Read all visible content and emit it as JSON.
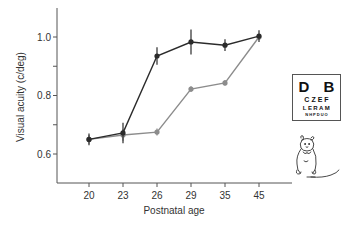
{
  "chart_data": {
    "type": "line",
    "title": "",
    "xlabel": "Postnatal age",
    "ylabel": "Visual acuity (c/deg)",
    "categories": [
      "20",
      "23",
      "26",
      "29",
      "35",
      "45"
    ],
    "x_tick_labels": [
      "20",
      "23",
      "26",
      "29",
      "35",
      "45"
    ],
    "y_tick_labels": [
      "0.6",
      "0.8",
      "1.0"
    ],
    "y_minor_ticks": [
      0.7,
      0.9
    ],
    "ylim": [
      0.5,
      1.1
    ],
    "grid": false,
    "legend": null,
    "series": [
      {
        "name": "dark",
        "color": "#2b2b2b",
        "values": [
          0.65,
          0.672,
          0.935,
          0.983,
          0.972,
          1.003
        ],
        "error": [
          0.02,
          0.035,
          0.03,
          0.043,
          0.02,
          0.02
        ]
      },
      {
        "name": "grey",
        "color": "#8c8c8c",
        "values": [
          0.65,
          0.665,
          0.675,
          0.822,
          0.843,
          1.0
        ],
        "error": [
          0.015,
          0.02,
          0.012,
          0.01,
          0.01,
          0.01
        ]
      }
    ]
  },
  "eye_chart": {
    "rows": [
      "D B",
      "CZEF",
      "LERAM",
      "NHPDUO"
    ]
  },
  "illustration": {
    "mouse_icon": "mouse-icon"
  }
}
